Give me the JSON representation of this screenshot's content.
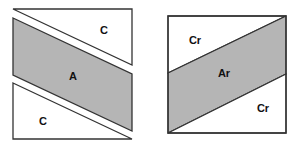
{
  "figures": {
    "left": {
      "top_piece": {
        "label": "C"
      },
      "middle_piece": {
        "label": "A"
      },
      "bottom_piece": {
        "label": "C"
      }
    },
    "right": {
      "top_piece": {
        "label": "Cr"
      },
      "middle_piece": {
        "label": "Ar"
      },
      "bottom_piece": {
        "label": "Cr"
      }
    }
  },
  "colors": {
    "shaded": "#b5b5b5",
    "outline": "#333333",
    "background": "#ffffff"
  }
}
